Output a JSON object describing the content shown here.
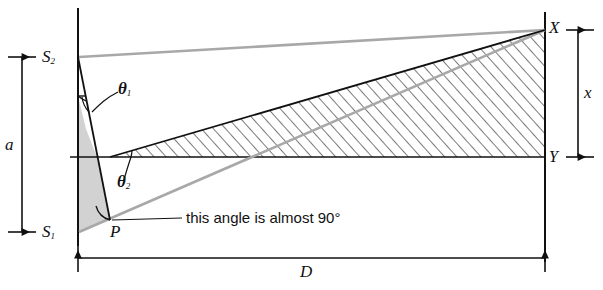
{
  "figure": {
    "type": "optics-double-slit-geometry-diagram",
    "background": "#ffffff",
    "colors": {
      "ink": "#111111",
      "gray_ray": "#a8a8a8",
      "gray_fill": "#d2d2d2",
      "hatch": "#2a2a2a"
    },
    "labels": {
      "source_top": "S",
      "source_top_sub": "2",
      "source_bottom": "S",
      "source_bottom_sub": "1",
      "slit_separation": "a",
      "screen_distance": "D",
      "screen_point_top": "X",
      "screen_point_bottom": "Y",
      "fringe_height": "x",
      "angle_one": "θ",
      "angle_one_sub": "1",
      "angle_two": "θ",
      "angle_two_sub": "2",
      "foot_point": "P",
      "annotation": "this angle is almost 90°"
    },
    "geometry": {
      "slit_axis_x": 78,
      "screen_axis_x": 545,
      "source_top_y": 57,
      "source_bottom_y": 232,
      "center_axis_y": 157,
      "point_x_y": 30,
      "point_p": [
        110,
        220
      ],
      "dimension_a": {
        "from": [
          22,
          57
        ],
        "to": [
          22,
          232
        ]
      },
      "dimension_D": {
        "from": [
          78,
          258
        ],
        "to": [
          545,
          258
        ]
      },
      "dimension_x": {
        "from": [
          575,
          30
        ],
        "to": [
          575,
          157
        ]
      }
    }
  }
}
